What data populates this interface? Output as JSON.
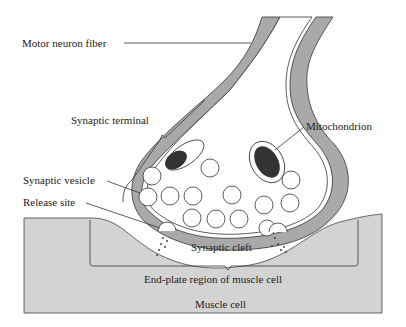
{
  "diagram": {
    "labels": {
      "motor_neuron_fiber": "Motor neuron fiber",
      "synaptic_terminal": "Synaptic terminal",
      "mitochondrion": "Mitochondrion",
      "synaptic_vesicle": "Synaptic vesicle",
      "release_site": "Release site",
      "synaptic_cleft": "Synaptic cleft",
      "end_plate_region": "End-plate region of muscle cell",
      "muscle_cell": "Muscle cell"
    },
    "colors": {
      "membrane_fill": "#a9a9a9",
      "muscle_fill": "#d3d3d3",
      "line": "#333333",
      "background": "#ffffff"
    }
  }
}
